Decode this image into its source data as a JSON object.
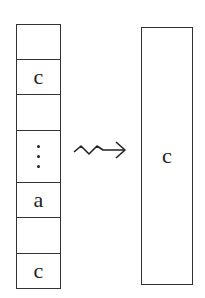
{
  "left_column": {
    "cells": [
      {
        "label": ""
      },
      {
        "label": "c"
      },
      {
        "label": ""
      },
      {
        "label": "⋮",
        "type": "ellipsis"
      },
      {
        "label": "a"
      },
      {
        "label": ""
      },
      {
        "label": "c"
      }
    ]
  },
  "arrow": {
    "type": "squiggly-arrow",
    "direction": "right"
  },
  "right_box": {
    "label": "c"
  },
  "colors": {
    "stroke": "#333333",
    "text": "#222222",
    "background": "#ffffff"
  }
}
